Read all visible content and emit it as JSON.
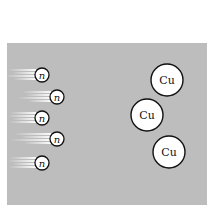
{
  "diagram": {
    "background_color": "#bdbdbd",
    "neutrons": [
      {
        "label": "n",
        "cx": 42,
        "cy": 75
      },
      {
        "label": "n",
        "cx": 57,
        "cy": 97
      },
      {
        "label": "n",
        "cx": 42,
        "cy": 118
      },
      {
        "label": "n",
        "cx": 57,
        "cy": 139
      },
      {
        "label": "n",
        "cx": 42,
        "cy": 163
      }
    ],
    "copper_atoms": [
      {
        "label": "Cu",
        "cx": 167,
        "cy": 80
      },
      {
        "label": "Cu",
        "cx": 147,
        "cy": 115
      },
      {
        "label": "Cu",
        "cx": 169,
        "cy": 152
      }
    ]
  }
}
